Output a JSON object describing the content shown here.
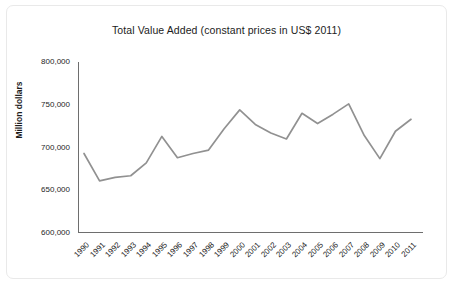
{
  "chart_data": {
    "type": "line",
    "title": "Total Value Added (constant prices in US$ 2011)",
    "xlabel": "",
    "ylabel": "Million dollars",
    "categories": [
      "1990",
      "1991",
      "1992",
      "1993",
      "1994",
      "1995",
      "1996",
      "1997",
      "1998",
      "1999",
      "2000",
      "2001",
      "2002",
      "2003",
      "2004",
      "2005",
      "2006",
      "2007",
      "2008",
      "2009",
      "2010",
      "2011"
    ],
    "values": [
      693000,
      661000,
      665000,
      667000,
      682000,
      713000,
      688000,
      693000,
      697000,
      722000,
      744000,
      727000,
      717000,
      710000,
      740000,
      728000,
      739000,
      751000,
      714000,
      687000,
      719000,
      733000
    ],
    "series": [
      {
        "name": "Total Value Added",
        "color": "#919191",
        "values": [
          693000,
          661000,
          665000,
          667000,
          682000,
          713000,
          688000,
          693000,
          697000,
          722000,
          744000,
          727000,
          717000,
          710000,
          740000,
          728000,
          739000,
          751000,
          714000,
          687000,
          719000,
          733000
        ]
      }
    ],
    "ylim": [
      600000,
      800000
    ],
    "y_ticks": [
      600000,
      650000,
      700000,
      750000,
      800000
    ],
    "y_tick_labels": [
      "600,000",
      "650,000",
      "700,000",
      "750,000",
      "800,000"
    ],
    "grid": false,
    "legend": false,
    "legend_position": "none",
    "x_tick_rotation": -45
  },
  "axis_colors": {
    "line": "#919191",
    "axis": "#6e6e6e",
    "text": "#262626",
    "background": "#ffffff"
  }
}
